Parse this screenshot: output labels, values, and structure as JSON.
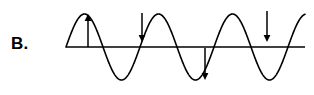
{
  "figure": {
    "label": "B.",
    "width": 314,
    "height": 95,
    "background_color": "#ffffff",
    "stroke_color": "#000000"
  },
  "chart_data": {
    "type": "line",
    "title": "",
    "subtitle": "",
    "xlabel": "",
    "ylabel": "",
    "grid": false,
    "legend": null,
    "axis": {
      "baseline_y_px": 47,
      "x_start_px": 66,
      "x_end_px": 305,
      "shown": true
    },
    "waveform": {
      "shape": "sine",
      "amplitude_px": 33,
      "period_px": 74,
      "cycles": 3.2,
      "phase": "starts at zero rising",
      "peak_y_px": 14,
      "trough_y_px": 80,
      "zero_crossings_px": [
        66,
        106,
        143,
        180,
        217,
        254,
        291
      ],
      "peaks_px": [
        88,
        162,
        236
      ],
      "troughs_px": [
        124,
        198,
        272
      ]
    },
    "annotations": [
      {
        "name": "arrow-1",
        "direction": "up",
        "x_px": 88,
        "y_start_px": 47,
        "y_end_px": 14,
        "location": "first crest",
        "label": ""
      },
      {
        "name": "arrow-2",
        "direction": "down",
        "x_px": 142,
        "y_start_px": 13,
        "y_end_px": 42,
        "location": "rising zero crossing",
        "label": ""
      },
      {
        "name": "arrow-3",
        "direction": "down",
        "x_px": 205,
        "y_start_px": 48,
        "y_end_px": 80,
        "location": "second trough",
        "label": ""
      },
      {
        "name": "arrow-4",
        "direction": "down",
        "x_px": 267,
        "y_start_px": 11,
        "y_end_px": 42,
        "location": "falling zero crossing",
        "label": ""
      }
    ]
  }
}
